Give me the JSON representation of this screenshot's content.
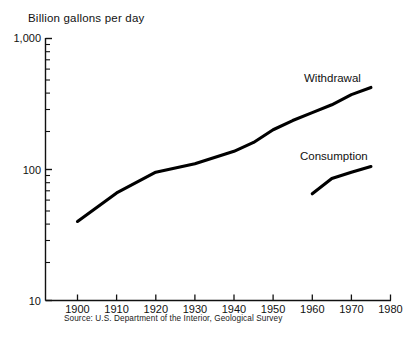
{
  "chart_data": {
    "type": "line",
    "title": "Billion gallons per day",
    "xlabel": "",
    "ylabel": "Billion gallons per day",
    "yscale": "log",
    "ylim": [
      10,
      1000
    ],
    "xlim": [
      1895,
      1980
    ],
    "grid": false,
    "legend_position": "inline-annotation",
    "x_ticks": [
      "1900",
      "1910",
      "1920",
      "1930",
      "1940",
      "1950",
      "1960",
      "1970",
      "1980"
    ],
    "x_tick_values": [
      1900,
      1910,
      1920,
      1930,
      1940,
      1950,
      1960,
      1970,
      1980
    ],
    "y_ticks": [
      "1,000",
      "100",
      "10"
    ],
    "y_tick_values": [
      1000,
      100,
      10
    ],
    "y_minor_ticks": [
      20,
      30,
      40,
      50,
      60,
      70,
      80,
      90,
      200,
      300,
      400,
      500,
      600,
      700,
      800,
      900
    ],
    "series": [
      {
        "name": "Withdrawal",
        "x": [
          1900,
          1910,
          1920,
          1930,
          1940,
          1945,
          1950,
          1955,
          1960,
          1965,
          1970,
          1975
        ],
        "values": [
          40,
          66,
          95,
          110,
          137,
          160,
          200,
          235,
          270,
          310,
          370,
          420
        ]
      },
      {
        "name": "Consumption",
        "x": [
          1960,
          1965,
          1970,
          1975
        ],
        "values": [
          65,
          85,
          95,
          105
        ]
      }
    ],
    "annotations": [
      {
        "text": "Withdrawal",
        "x": 1966,
        "y": 560
      },
      {
        "text": "Consumption",
        "x": 1962,
        "y": 135
      }
    ],
    "source_note": "Source: U.S. Department of the Interior, Geological Survey",
    "colors": {
      "line": "#000000",
      "text": "#111111",
      "axis": "#111111",
      "background": "#ffffff"
    }
  },
  "labels": {
    "axis_title": "Billion gallons per day",
    "y_top": "1,000",
    "y_mid": "100",
    "y_bottom": "10",
    "x_1900": "1900",
    "x_1910": "1910",
    "x_1920": "1920",
    "x_1930": "1930",
    "x_1940": "1940",
    "x_1950": "1950",
    "x_1960": "1960",
    "x_1970": "1970",
    "x_1980": "1980",
    "series_withdrawal": "Withdrawal",
    "series_consumption": "Consumption",
    "source": "Source: U.S. Department of the Interior, Geological Survey"
  }
}
